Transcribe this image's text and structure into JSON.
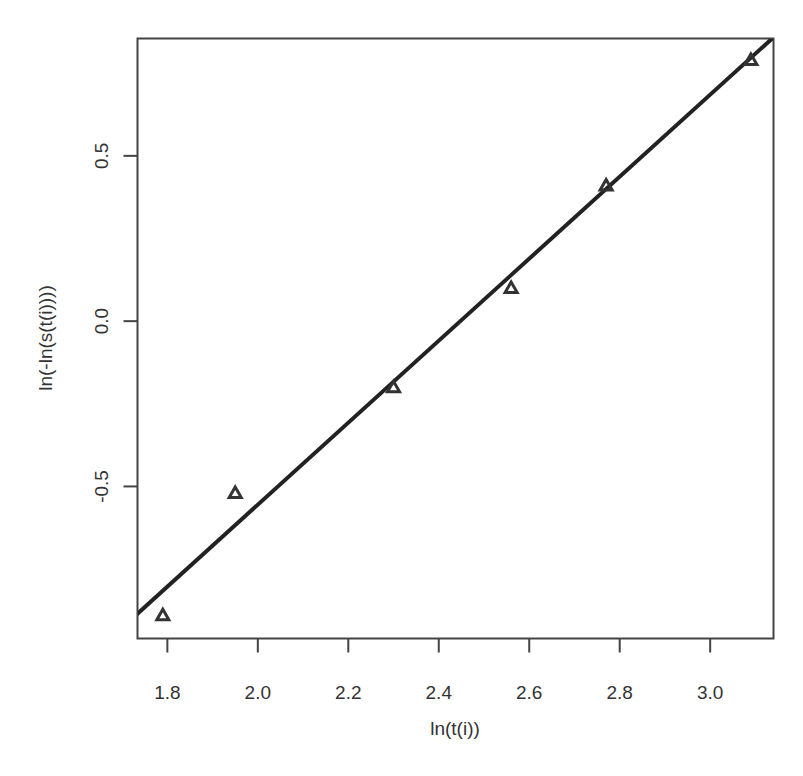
{
  "chart_data": {
    "type": "scatter",
    "title": "",
    "xlabel": "ln(t(i))",
    "ylabel": "ln(-ln(s(t(i))))",
    "xlim": [
      1.734,
      3.14
    ],
    "ylim": [
      -0.96,
      0.855
    ],
    "grid": false,
    "legend": null,
    "x_ticks": [
      1.8,
      2.0,
      2.2,
      2.4,
      2.6,
      2.8,
      3.0
    ],
    "x_tick_labels": [
      "1.8",
      "2.0",
      "2.2",
      "2.4",
      "2.6",
      "2.8",
      "3.0"
    ],
    "y_ticks": [
      -0.5,
      0.0,
      0.5
    ],
    "y_tick_labels": [
      "-0.5",
      "0.0",
      "0.5"
    ],
    "series": [
      {
        "name": "observed",
        "marker": "triangle",
        "x": [
          1.79,
          1.95,
          2.3,
          2.56,
          2.77,
          3.09
        ],
        "y": [
          -0.89,
          -0.52,
          -0.2,
          0.1,
          0.41,
          0.79
        ]
      }
    ],
    "fit_line": {
      "slope": 1.24,
      "intercept": -3.035,
      "style": "solid",
      "color": "#222222"
    }
  },
  "colors": {
    "line": "#222222",
    "axis": "#444444",
    "marker": "#333333"
  }
}
